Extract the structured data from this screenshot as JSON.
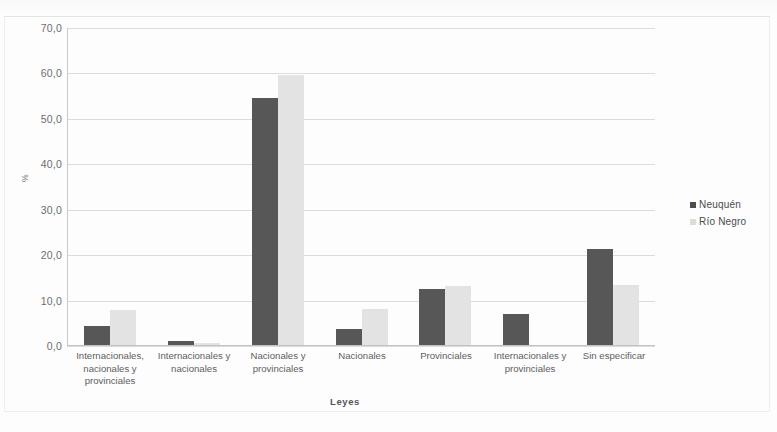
{
  "chart_data": {
    "type": "bar",
    "title": "",
    "subtitle": "",
    "xlabel": "Leyes",
    "ylabel": "%",
    "ylim": [
      0,
      70
    ],
    "yticks": [
      0,
      10,
      20,
      30,
      40,
      50,
      60,
      70
    ],
    "ytick_labels": [
      "0,0",
      "10,0",
      "20,0",
      "30,0",
      "40,0",
      "50,0",
      "60,0",
      "70,0"
    ],
    "grid": true,
    "legend_position": "right",
    "categories": [
      "Internacionales, nacionales y provinciales",
      "Internacionales y nacionales",
      "Nacionales y provinciales",
      "Nacionales",
      "Provinciales",
      "Internacionales y provinciales",
      "Sin especificar"
    ],
    "series": [
      {
        "name": "Neuquén",
        "color": "#575757",
        "values": [
          4.2,
          0.8,
          54.3,
          3.5,
          12.3,
          6.8,
          21.2
        ]
      },
      {
        "name": "Río Negro",
        "color": "#e3e3e3",
        "values": [
          7.8,
          0.5,
          59.4,
          8.0,
          13.0,
          0.0,
          13.3
        ]
      }
    ]
  },
  "axis": {
    "y_title": "%",
    "x_title": "Leyes"
  }
}
